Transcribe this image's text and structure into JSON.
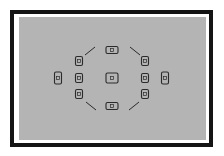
{
  "diagram": {
    "title": "",
    "colors": {
      "frame": "#141414",
      "matte": "#ffffff",
      "screen": "#b4b4b4",
      "marks": "#2a2a2a"
    },
    "af_points": [
      {
        "id": "top",
        "x": 112,
        "y": 50,
        "w": 12,
        "h": 7,
        "orientation": "horizontal"
      },
      {
        "id": "center",
        "x": 112,
        "y": 78,
        "w": 12,
        "h": 10,
        "orientation": "horizontal"
      },
      {
        "id": "bottom",
        "x": 112,
        "y": 106,
        "w": 12,
        "h": 7,
        "orientation": "horizontal"
      },
      {
        "id": "left-top",
        "x": 79,
        "y": 61,
        "w": 7,
        "h": 9,
        "orientation": "vertical"
      },
      {
        "id": "left-mid",
        "x": 79,
        "y": 78,
        "w": 7,
        "h": 9,
        "orientation": "vertical"
      },
      {
        "id": "left-bottom",
        "x": 79,
        "y": 94,
        "w": 7,
        "h": 9,
        "orientation": "vertical"
      },
      {
        "id": "right-top",
        "x": 145,
        "y": 61,
        "w": 7,
        "h": 9,
        "orientation": "vertical"
      },
      {
        "id": "right-mid",
        "x": 145,
        "y": 78,
        "w": 7,
        "h": 9,
        "orientation": "vertical"
      },
      {
        "id": "right-bottom",
        "x": 145,
        "y": 94,
        "w": 7,
        "h": 9,
        "orientation": "vertical"
      },
      {
        "id": "far-left",
        "x": 58,
        "y": 78,
        "w": 7,
        "h": 12,
        "orientation": "vertical"
      },
      {
        "id": "far-right",
        "x": 165,
        "y": 78,
        "w": 7,
        "h": 12,
        "orientation": "vertical"
      }
    ],
    "area_marks": [
      {
        "id": "top-left",
        "x1": 85,
        "y1": 55,
        "x2": 95,
        "y2": 47
      },
      {
        "id": "top-right",
        "x1": 130,
        "y1": 47,
        "x2": 140,
        "y2": 55
      },
      {
        "id": "bottom-left",
        "x1": 86,
        "y1": 102,
        "x2": 96,
        "y2": 110
      },
      {
        "id": "bottom-right",
        "x1": 129,
        "y1": 110,
        "x2": 139,
        "y2": 102
      }
    ]
  }
}
